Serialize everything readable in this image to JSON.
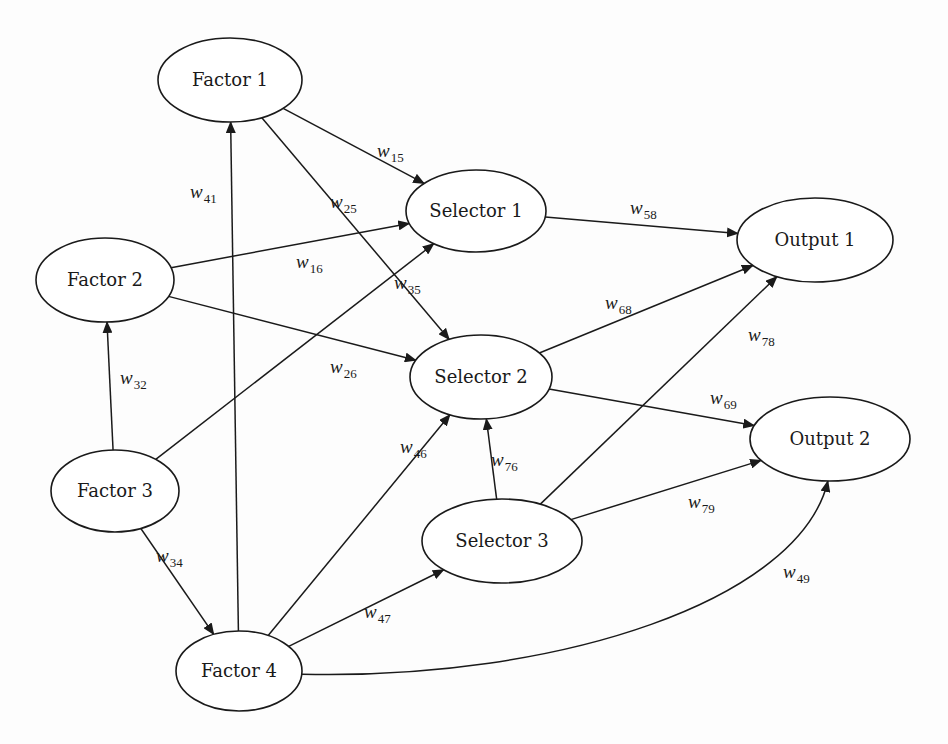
{
  "diagram": {
    "type": "directed-network",
    "nodes": [
      {
        "id": "F1",
        "label": "Factor 1",
        "cx": 230,
        "cy": 80,
        "rx": 72,
        "ry": 42
      },
      {
        "id": "F2",
        "label": "Factor 2",
        "cx": 105,
        "cy": 280,
        "rx": 69,
        "ry": 42
      },
      {
        "id": "F3",
        "label": "Factor 3",
        "cx": 115,
        "cy": 491,
        "rx": 64,
        "ry": 41
      },
      {
        "id": "F4",
        "label": "Factor 4",
        "cx": 239,
        "cy": 671,
        "rx": 63,
        "ry": 40
      },
      {
        "id": "S1",
        "label": "Selector 1",
        "cx": 476,
        "cy": 211,
        "rx": 70,
        "ry": 41
      },
      {
        "id": "S2",
        "label": "Selector 2",
        "cx": 481,
        "cy": 377,
        "rx": 71,
        "ry": 42
      },
      {
        "id": "S3",
        "label": "Selector 3",
        "cx": 502,
        "cy": 541,
        "rx": 80,
        "ry": 42
      },
      {
        "id": "O1",
        "label": "Output 1",
        "cx": 815,
        "cy": 240,
        "rx": 78,
        "ry": 42
      },
      {
        "id": "O2",
        "label": "Output 2",
        "cx": 830,
        "cy": 439,
        "rx": 80,
        "ry": 42
      }
    ],
    "edges": [
      {
        "from": "F1",
        "to": "S1",
        "weight": "w",
        "sub": "15",
        "lx": 377,
        "ly": 157
      },
      {
        "from": "F1",
        "to": "S2",
        "weight": "w",
        "sub": "25",
        "lx": 330,
        "ly": 208
      },
      {
        "from": "F4",
        "to": "F1",
        "weight": "w",
        "sub": "41",
        "lx": 190,
        "ly": 198
      },
      {
        "from": "F2",
        "to": "S1",
        "weight": "w",
        "sub": "16",
        "lx": 296,
        "ly": 268
      },
      {
        "from": "F2",
        "to": "S2",
        "weight": "w",
        "sub": "26",
        "lx": 330,
        "ly": 373
      },
      {
        "from": "F3",
        "to": "S1",
        "weight": "w",
        "sub": "35",
        "lx": 394,
        "ly": 289
      },
      {
        "from": "F3",
        "to": "F2",
        "weight": "w",
        "sub": "32",
        "lx": 120,
        "ly": 384
      },
      {
        "from": "F3",
        "to": "F4",
        "weight": "w",
        "sub": "34",
        "lx": 156,
        "ly": 562
      },
      {
        "from": "F4",
        "to": "S2",
        "weight": "w",
        "sub": "46",
        "lx": 400,
        "ly": 453
      },
      {
        "from": "F4",
        "to": "S3",
        "weight": "w",
        "sub": "47",
        "lx": 364,
        "ly": 618
      },
      {
        "from": "F4",
        "to": "O2",
        "weight": "w",
        "sub": "49",
        "lx": 783,
        "ly": 578,
        "curved": true
      },
      {
        "from": "S3",
        "to": "S2",
        "weight": "w",
        "sub": "76",
        "lx": 491,
        "ly": 466
      },
      {
        "from": "S1",
        "to": "O1",
        "weight": "w",
        "sub": "58",
        "lx": 630,
        "ly": 214
      },
      {
        "from": "S2",
        "to": "O1",
        "weight": "w",
        "sub": "68",
        "lx": 605,
        "ly": 309
      },
      {
        "from": "S2",
        "to": "O2",
        "weight": "w",
        "sub": "69",
        "lx": 710,
        "ly": 404
      },
      {
        "from": "S3",
        "to": "O1",
        "weight": "w",
        "sub": "78",
        "lx": 748,
        "ly": 341
      },
      {
        "from": "S3",
        "to": "O2",
        "weight": "w",
        "sub": "79",
        "lx": 688,
        "ly": 508
      }
    ]
  }
}
